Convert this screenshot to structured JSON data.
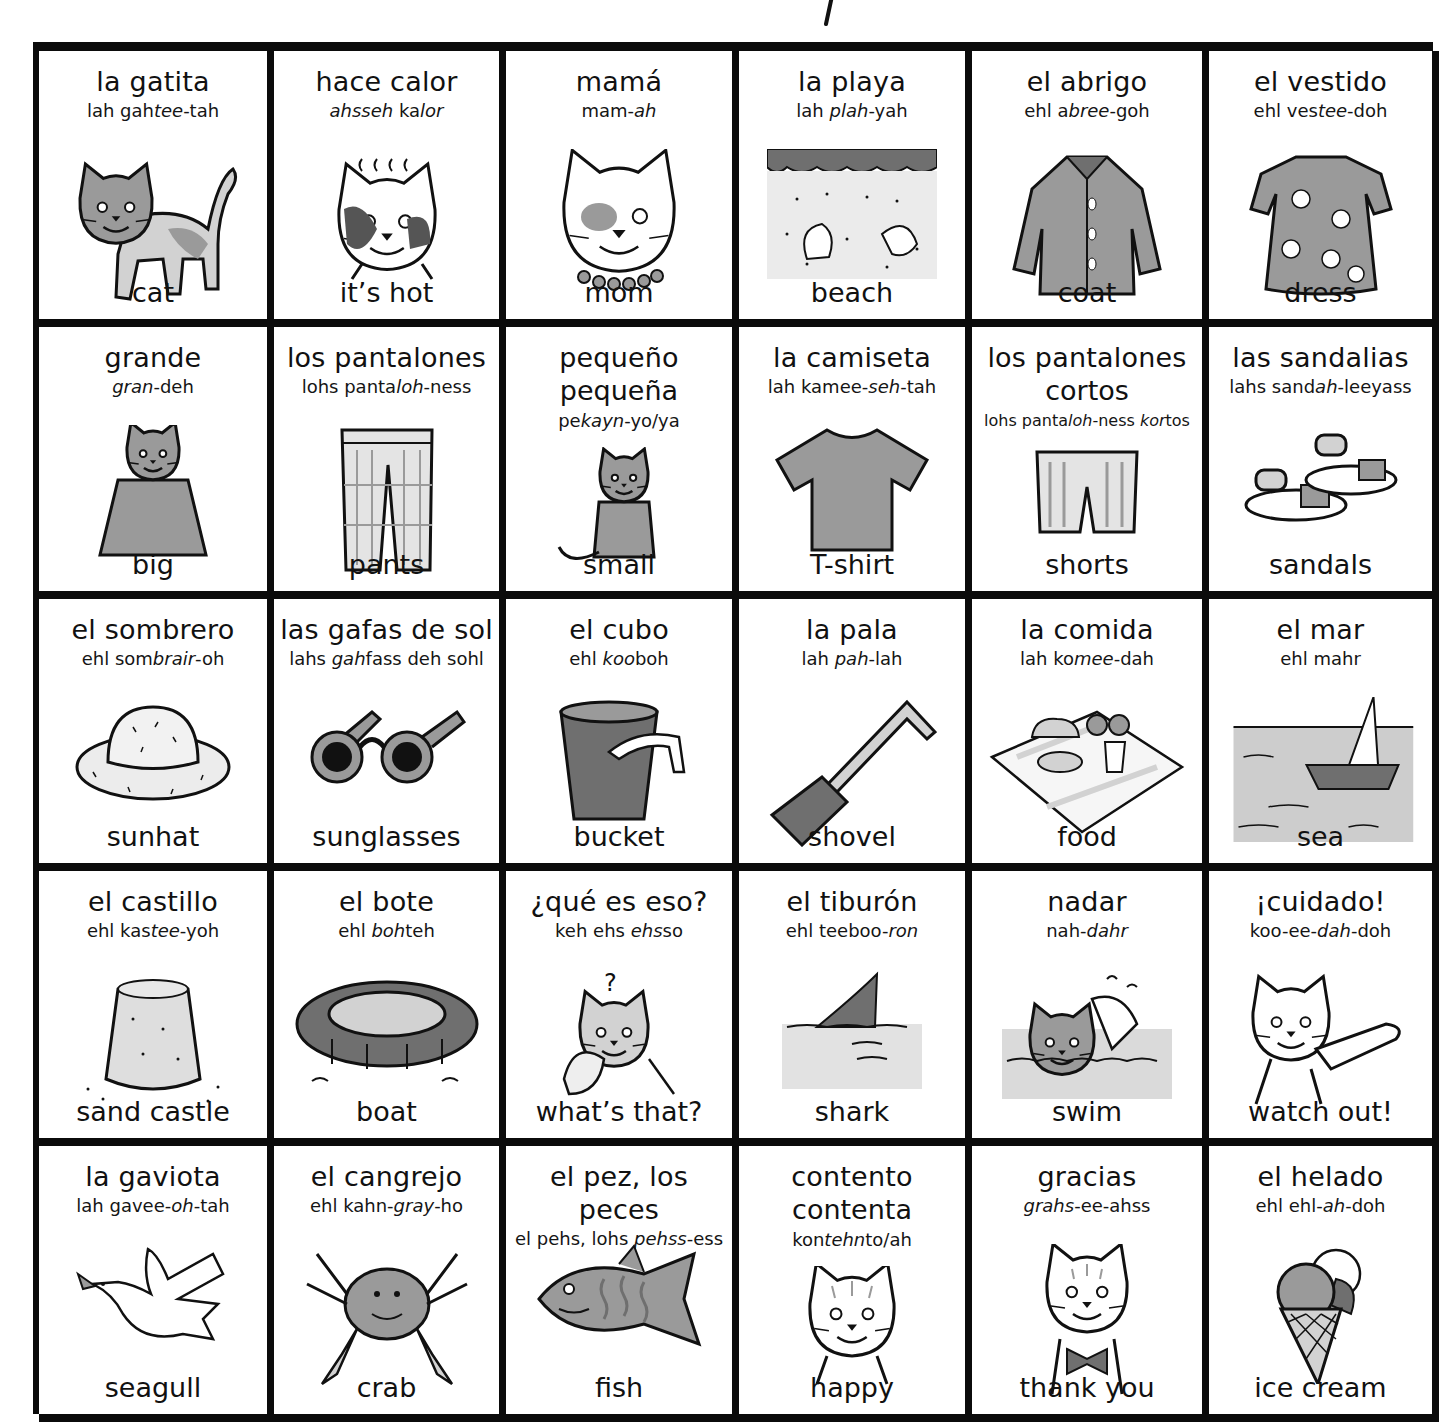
{
  "page": {
    "title_fragment": "/",
    "grid": {
      "columns": 6,
      "rows": 5,
      "border_color": "#0b0b0b",
      "ink_gray": "#8c8c8c"
    }
  },
  "cards": [
    {
      "es": "la gatita",
      "es2": "",
      "pron": [
        [
          "lah gah",
          ""
        ],
        [
          "tee",
          "i"
        ],
        [
          "-tah",
          ""
        ]
      ],
      "en": "cat",
      "icon": "cat-icon"
    },
    {
      "es": "hace calor",
      "es2": "",
      "pron": [
        [
          "ahsseh",
          "i"
        ],
        [
          " ka",
          ""
        ],
        [
          "lor",
          "i"
        ]
      ],
      "en": "it’s hot",
      "icon": "hot-cat-icon"
    },
    {
      "es": "mamá",
      "es2": "",
      "pron": [
        [
          "mam-",
          ""
        ],
        [
          "ah",
          "i"
        ]
      ],
      "en": "mom",
      "icon": "mother-cat-icon"
    },
    {
      "es": "la playa",
      "es2": "",
      "pron": [
        [
          "lah ",
          ""
        ],
        [
          "plah",
          "i"
        ],
        [
          "-yah",
          ""
        ]
      ],
      "en": "beach",
      "icon": "beach-icon"
    },
    {
      "es": "el abrigo",
      "es2": "",
      "pron": [
        [
          "ehl a",
          ""
        ],
        [
          "bree",
          "i"
        ],
        [
          "-goh",
          ""
        ]
      ],
      "en": "coat",
      "icon": "coat-icon"
    },
    {
      "es": "el vestido",
      "es2": "",
      "pron": [
        [
          "ehl ves",
          ""
        ],
        [
          "tee",
          "i"
        ],
        [
          "-doh",
          ""
        ]
      ],
      "en": "dress",
      "icon": "dress-icon"
    },
    {
      "es": "grande",
      "es2": "",
      "pron": [
        [
          "gran",
          "i"
        ],
        [
          "-deh",
          ""
        ]
      ],
      "en": "big",
      "icon": "big-cat-icon"
    },
    {
      "es": "los pantalones",
      "es2": "",
      "pron": [
        [
          "lohs panta",
          ""
        ],
        [
          "loh",
          "i"
        ],
        [
          "-ness",
          ""
        ]
      ],
      "en": "pants",
      "icon": "pants-icon"
    },
    {
      "es": "pequeño",
      "es2": "pequeña",
      "pron": [
        [
          "pe",
          ""
        ],
        [
          "kayn",
          "i"
        ],
        [
          "-yo/ya",
          ""
        ]
      ],
      "en": "small",
      "icon": "small-cat-icon"
    },
    {
      "es": "la camiseta",
      "es2": "",
      "pron": [
        [
          "lah kamee-",
          ""
        ],
        [
          "seh",
          "i"
        ],
        [
          "-tah",
          ""
        ]
      ],
      "en": "T-shirt",
      "icon": "tshirt-icon"
    },
    {
      "es": "los pantalones",
      "es2": "cortos",
      "pron": [
        [
          "lohs panta",
          ""
        ],
        [
          "loh",
          "i"
        ],
        [
          "-ness ",
          ""
        ],
        [
          "kor",
          "i"
        ],
        [
          "tos",
          ""
        ]
      ],
      "en": "shorts",
      "icon": "shorts-icon"
    },
    {
      "es": "las sandalias",
      "es2": "",
      "pron": [
        [
          "lahs sand",
          ""
        ],
        [
          "ah",
          "i"
        ],
        [
          "-leeyass",
          ""
        ]
      ],
      "en": "sandals",
      "icon": "sandals-icon"
    },
    {
      "es": "el sombrero",
      "es2": "",
      "pron": [
        [
          "ehl som",
          ""
        ],
        [
          "brair",
          "i"
        ],
        [
          "-oh",
          ""
        ]
      ],
      "en": "sunhat",
      "icon": "sunhat-icon"
    },
    {
      "es": "las gafas de sol",
      "es2": "",
      "pron": [
        [
          "lahs ",
          ""
        ],
        [
          "gah",
          "i"
        ],
        [
          "fass deh sohl",
          ""
        ]
      ],
      "en": "sunglasses",
      "icon": "sunglasses-icon"
    },
    {
      "es": "el cubo",
      "es2": "",
      "pron": [
        [
          "ehl ",
          ""
        ],
        [
          "koo",
          "i"
        ],
        [
          "boh",
          ""
        ]
      ],
      "en": "bucket",
      "icon": "bucket-icon"
    },
    {
      "es": "la pala",
      "es2": "",
      "pron": [
        [
          "lah ",
          ""
        ],
        [
          "pah",
          "i"
        ],
        [
          "-lah",
          ""
        ]
      ],
      "en": "shovel",
      "icon": "shovel-icon"
    },
    {
      "es": "la comida",
      "es2": "",
      "pron": [
        [
          "lah ko",
          ""
        ],
        [
          "mee",
          "i"
        ],
        [
          "-dah",
          ""
        ]
      ],
      "en": "food",
      "icon": "food-icon"
    },
    {
      "es": "el mar",
      "es2": "",
      "pron": [
        [
          "ehl mahr",
          ""
        ]
      ],
      "en": "sea",
      "icon": "sea-icon"
    },
    {
      "es": "el castillo",
      "es2": "",
      "pron": [
        [
          "ehl kas",
          ""
        ],
        [
          "tee",
          "i"
        ],
        [
          "-yoh",
          ""
        ]
      ],
      "en": "sand castle",
      "icon": "sandcastle-icon"
    },
    {
      "es": "el bote",
      "es2": "",
      "pron": [
        [
          "ehl ",
          ""
        ],
        [
          "boh",
          "i"
        ],
        [
          "teh",
          ""
        ]
      ],
      "en": "boat",
      "icon": "dinghy-icon"
    },
    {
      "es": "¿qué es eso?",
      "es2": "",
      "pron": [
        [
          "keh ehs ",
          ""
        ],
        [
          "ehs",
          "i"
        ],
        [
          "so",
          ""
        ]
      ],
      "en": "what’s that?",
      "icon": "puzzled-cat-icon"
    },
    {
      "es": "el tiburón",
      "es2": "",
      "pron": [
        [
          "ehl teeboo-",
          ""
        ],
        [
          "ron",
          "i"
        ]
      ],
      "en": "shark",
      "icon": "shark-fin-icon"
    },
    {
      "es": "nadar",
      "es2": "",
      "pron": [
        [
          "nah-",
          ""
        ],
        [
          "dahr",
          "i"
        ]
      ],
      "en": "swim",
      "icon": "swimming-cat-icon"
    },
    {
      "es": "¡cuidado!",
      "es2": "",
      "pron": [
        [
          "koo-ee-",
          ""
        ],
        [
          "dah",
          "i"
        ],
        [
          "-doh",
          ""
        ]
      ],
      "en": "watch out!",
      "icon": "pointing-cat-icon"
    },
    {
      "es": "la gaviota",
      "es2": "",
      "pron": [
        [
          "lah ",
          ""
        ],
        [
          "gavee-",
          ""
        ],
        [
          "oh",
          "i"
        ],
        [
          "-tah",
          ""
        ]
      ],
      "en": "seagull",
      "icon": "seagull-icon"
    },
    {
      "es": "el cangrejo",
      "es2": "",
      "pron": [
        [
          "ehl kahn-",
          ""
        ],
        [
          "gray",
          "i"
        ],
        [
          "-ho",
          ""
        ]
      ],
      "en": "crab",
      "icon": "crab-icon"
    },
    {
      "es": "el pez, los peces",
      "es2": "",
      "pron": [
        [
          "el pehs, lohs ",
          ""
        ],
        [
          "pehss",
          "i"
        ],
        [
          "-ess",
          ""
        ]
      ],
      "en": "fish",
      "icon": "fish-icon"
    },
    {
      "es": "contento",
      "es2": "contenta",
      "pron": [
        [
          "kon",
          ""
        ],
        [
          "tehn",
          "i"
        ],
        [
          "to/ah",
          ""
        ]
      ],
      "en": "happy",
      "icon": "happy-cat-icon"
    },
    {
      "es": "gracias",
      "es2": "",
      "pron": [
        [
          "grahs",
          "i"
        ],
        [
          "-ee-ahss",
          ""
        ]
      ],
      "en": "thank you",
      "icon": "bowtie-cat-icon"
    },
    {
      "es": "el helado",
      "es2": "",
      "pron": [
        [
          "ehl ehl-",
          ""
        ],
        [
          "ah",
          "i"
        ],
        [
          "-doh",
          ""
        ]
      ],
      "en": "ice cream",
      "icon": "ice-cream-icon"
    }
  ]
}
